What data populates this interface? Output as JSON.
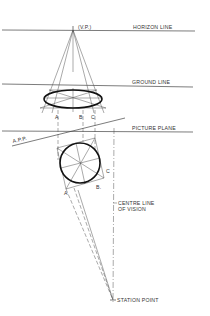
{
  "diagram": {
    "labels": {
      "vp": "(V.P.)",
      "horizon_line": "HORIZON LINE",
      "ground_line": "GROUND LINE",
      "picture_plane": "PICTURE PLANE",
      "app": "A.P.P.",
      "centre_line_1": "CENTRE LINE",
      "centre_line_2": "OF VISION",
      "station_point": "STATION POINT",
      "point_a_top": "A",
      "point_b_top": "B",
      "point_c_top": "C",
      "point_a_plan": "A",
      "point_b_plan": "B.",
      "point_c_plan": "C"
    },
    "colors": {
      "line": "#555555",
      "bold_line": "#111111",
      "background": "#ffffff"
    }
  }
}
